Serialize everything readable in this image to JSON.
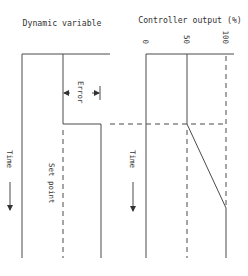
{
  "diagram": {
    "left_panel": {
      "title": "Dynamic variable",
      "error_label": "Error",
      "setpoint_label": "Set point",
      "time_label": "Time"
    },
    "right_panel": {
      "title": "Controller output (%)",
      "ticks": [
        "0",
        "50",
        "100"
      ],
      "time_label": "Time"
    },
    "colors": {
      "line": "#4a4a4a",
      "text": "#333333",
      "background": "#ffffff"
    }
  }
}
